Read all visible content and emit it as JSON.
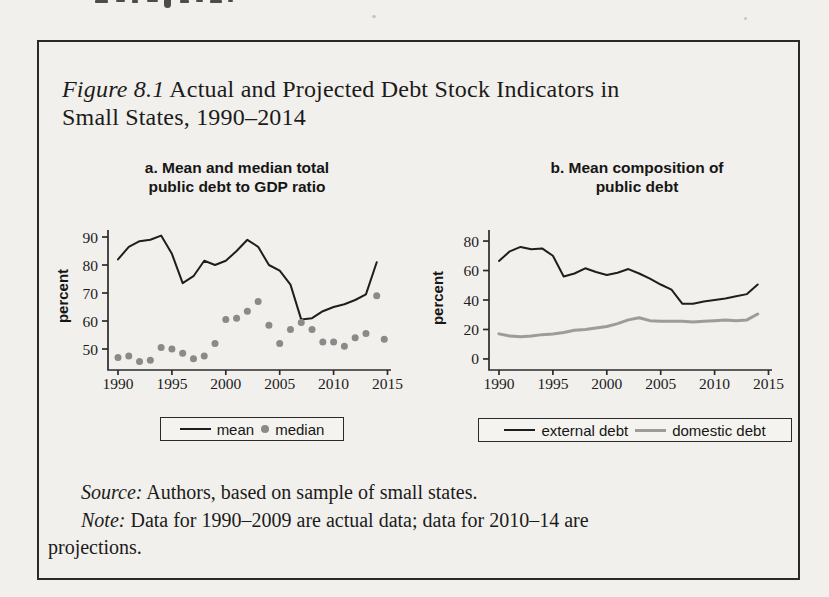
{
  "page_background": "#f2f0ec",
  "figure": {
    "title": {
      "prefix": "Figure 8.1",
      "line1_rest": " Actual and Projected Debt Stock Indicators in",
      "line2": "Small States, 1990–2014"
    },
    "source": {
      "prefix": "Source:",
      "text": " Authors, based on sample of small states."
    },
    "note": {
      "prefix": "Note:",
      "line1": " Data for 1990–2009 are actual data; data for 2010–14 are",
      "line2": "projections."
    }
  },
  "colors": {
    "black_line": "#1e1e1e",
    "gray_line": "#9c9c9c",
    "gray_dot": "#8a8a8a",
    "axis": "#2b2b2b",
    "tick_text": "#1c1c1c"
  },
  "chart_data": [
    {
      "type": "line",
      "panel": "a",
      "title_lines": [
        "a. Mean and median total",
        "public debt to GDP ratio"
      ],
      "ylabel": "percent",
      "years": [
        1990,
        1991,
        1992,
        1993,
        1994,
        1995,
        1996,
        1997,
        1998,
        1999,
        2000,
        2001,
        2002,
        2003,
        2004,
        2005,
        2006,
        2007,
        2008,
        2009,
        2010,
        2011,
        2012,
        2013,
        2014
      ],
      "x_ticks": [
        1990,
        1995,
        2000,
        2005,
        2010,
        2015
      ],
      "y_ticks": [
        50,
        60,
        70,
        80,
        90
      ],
      "ylim": [
        42.5,
        92.5
      ],
      "grid": false,
      "legend_position": "bottom",
      "series": [
        {
          "name": "mean",
          "style": "line",
          "color": "#1e1e1e",
          "width": 2,
          "values": [
            82,
            86.5,
            88.5,
            89,
            90.5,
            84,
            73.5,
            76,
            81.5,
            80,
            81.5,
            85,
            89,
            86.5,
            80,
            78,
            73,
            60.5,
            61,
            63.5,
            65,
            66,
            67.5,
            69.5,
            81
          ]
        },
        {
          "name": "median",
          "style": "dots",
          "color": "#8a8a8a",
          "radius": 3.5,
          "values": [
            47,
            47.5,
            45.5,
            46,
            50.5,
            50,
            48.5,
            46.5,
            47.5,
            52,
            60.5,
            61,
            63.5,
            67,
            58.5,
            52,
            57,
            59.5,
            57,
            52.5,
            52.5,
            51,
            54,
            55.5,
            69
          ],
          "extra_points": [
            {
              "x": 2014.7,
              "value": 53.5
            }
          ]
        }
      ],
      "legend": [
        {
          "label": "mean",
          "swatch": "line",
          "color": "#1e1e1e"
        },
        {
          "label": "median",
          "swatch": "dot",
          "color": "#8a8a8a"
        }
      ]
    },
    {
      "type": "line",
      "panel": "b",
      "title_lines": [
        "b. Mean composition of",
        "public debt"
      ],
      "ylabel": "percent",
      "years": [
        1990,
        1991,
        1992,
        1993,
        1994,
        1995,
        1996,
        1997,
        1998,
        1999,
        2000,
        2001,
        2002,
        2003,
        2004,
        2005,
        2006,
        2007,
        2008,
        2009,
        2010,
        2011,
        2012,
        2013,
        2014
      ],
      "x_ticks": [
        1990,
        1995,
        2000,
        2005,
        2010,
        2015
      ],
      "y_ticks": [
        0,
        20,
        40,
        60,
        80
      ],
      "ylim": [
        -7.5,
        87.5
      ],
      "grid": false,
      "legend_position": "bottom",
      "series": [
        {
          "name": "external debt",
          "style": "line",
          "color": "#1e1e1e",
          "width": 2,
          "values": [
            66.5,
            73,
            76,
            74.5,
            75,
            70,
            56,
            58,
            61.5,
            59,
            57,
            58.5,
            61,
            58,
            54.5,
            50.5,
            47,
            37.5,
            37.5,
            39,
            40,
            41,
            42.5,
            44,
            50.5
          ]
        },
        {
          "name": "domestic debt",
          "style": "line",
          "color": "#9c9c9c",
          "width": 3,
          "values": [
            17,
            15.5,
            15,
            15.5,
            16.5,
            17,
            18,
            19.5,
            20,
            21,
            22,
            24,
            26.5,
            28,
            26,
            25.5,
            25.5,
            25.5,
            25,
            25.5,
            26,
            26.5,
            26,
            26.5,
            30.5
          ]
        }
      ],
      "legend": [
        {
          "label": "external debt",
          "swatch": "line",
          "color": "#1e1e1e"
        },
        {
          "label": "domestic debt",
          "swatch": "line-gray",
          "color": "#9c9c9c"
        }
      ]
    }
  ]
}
